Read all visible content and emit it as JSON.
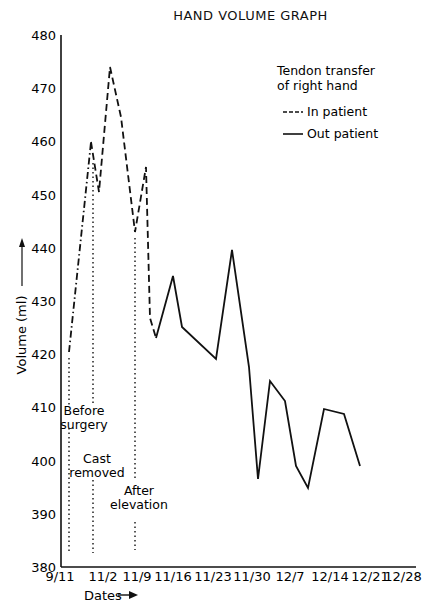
{
  "chart_data": {
    "type": "line",
    "title": "HAND VOLUME GRAPH",
    "xlabel": "Dates",
    "ylabel": "Volume (ml)",
    "ylim": [
      380,
      480
    ],
    "yticks": [
      380,
      390,
      400,
      410,
      420,
      430,
      440,
      450,
      460,
      470,
      480
    ],
    "xticks": [
      "9/11",
      "11/2",
      "11/9",
      "11/16",
      "11/23",
      "11/30",
      "12/7",
      "12/14",
      "12/21",
      "12/28"
    ],
    "grid": false,
    "legend": {
      "title": "Tendon transfer of right hand",
      "position": "upper right",
      "entries": [
        "In patient",
        "Out patient"
      ]
    },
    "series": [
      {
        "name": "In patient",
        "style": "dashed",
        "points": [
          {
            "x": "9/11",
            "y": 421
          },
          {
            "x": "~10/26",
            "y": 460
          },
          {
            "x": "~10/28",
            "y": 450
          },
          {
            "x": "~11/2",
            "y": 474
          },
          {
            "x": "~11/4",
            "y": 463
          },
          {
            "x": "~11/9",
            "y": 442
          },
          {
            "x": "~11/11",
            "y": 455
          },
          {
            "x": "~11/12",
            "y": 427
          }
        ]
      },
      {
        "name": "Out patient",
        "style": "solid",
        "points": [
          {
            "x": "~11/12",
            "y": 423
          },
          {
            "x": "~11/16",
            "y": 435
          },
          {
            "x": "~11/18",
            "y": 425.5
          },
          {
            "x": "~11/24",
            "y": 419.5
          },
          {
            "x": "~11/27",
            "y": 440
          },
          {
            "x": "~11/30",
            "y": 418
          },
          {
            "x": "~12/1",
            "y": 397
          },
          {
            "x": "~12/4",
            "y": 415.5
          },
          {
            "x": "~12/6",
            "y": 411.5
          },
          {
            "x": "~12/8",
            "y": 399
          },
          {
            "x": "~12/10",
            "y": 395.5
          },
          {
            "x": "~12/13",
            "y": 410.5
          },
          {
            "x": "~12/17",
            "y": 409.5
          },
          {
            "x": "~12/20",
            "y": 399.5
          }
        ]
      }
    ],
    "annotations": [
      {
        "text": "Before surgery",
        "lines": [
          "Before",
          "surgery"
        ],
        "x": "9/11"
      },
      {
        "text": "Cast removed",
        "lines": [
          "Cast",
          "removed"
        ],
        "x": "~10/26"
      },
      {
        "text": "After elevation",
        "lines": [
          "After",
          "elevation"
        ],
        "x": "~11/9"
      }
    ]
  }
}
